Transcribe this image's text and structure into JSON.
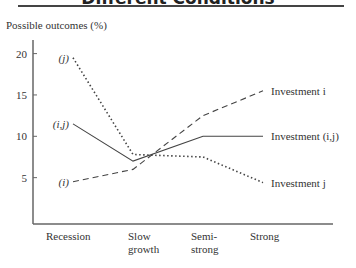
{
  "title": "Different Conditions",
  "chart_data": {
    "type": "line",
    "title": "Different Conditions",
    "ylabel": "Possible outcomes (%)",
    "xlabel": "",
    "categories": [
      "Recession",
      "Slow growth",
      "Semi-strong",
      "Strong"
    ],
    "yticks": [
      5,
      10,
      15,
      20
    ],
    "ylim": [
      0,
      22
    ],
    "grid": false,
    "series": [
      {
        "name": "Investment i",
        "start_label": "(i)",
        "style": "dashed",
        "values": [
          4.5,
          6.0,
          12.5,
          15.5
        ]
      },
      {
        "name": "Investment (i,j)",
        "start_label": "(i,j)",
        "style": "solid",
        "values": [
          11.5,
          7.0,
          10.0,
          10.0
        ]
      },
      {
        "name": "Investment j",
        "start_label": "(j)",
        "style": "dotted",
        "values": [
          19.5,
          7.8,
          7.5,
          4.4
        ]
      }
    ]
  }
}
